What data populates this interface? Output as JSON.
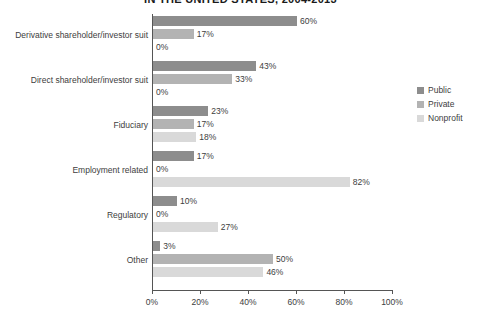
{
  "chart_data": {
    "type": "bar",
    "orientation": "horizontal",
    "title": "IN THE UNITED STATES, 2004-2013",
    "xlabel": "",
    "ylabel": "",
    "xlim": [
      0,
      100
    ],
    "grid": false,
    "legend_position": "right",
    "categories": [
      "Derivative shareholder/investor suit",
      "Direct shareholder/investor suit",
      "Fiduciary",
      "Employment related",
      "Regulatory",
      "Other"
    ],
    "series": [
      {
        "name": "Public",
        "color": "#8d8d8d",
        "values": [
          60,
          43,
          23,
          17,
          10,
          3
        ],
        "labels": [
          "60%",
          "43%",
          "23%",
          "17%",
          "10%",
          "3%"
        ]
      },
      {
        "name": "Private",
        "color": "#b3b3b3",
        "values": [
          17,
          33,
          17,
          0,
          0,
          50
        ],
        "labels": [
          "17%",
          "33%",
          "17%",
          "0%",
          "0%",
          "50%"
        ]
      },
      {
        "name": "Nonprofit",
        "color": "#d9d9d9",
        "values": [
          0,
          0,
          18,
          82,
          27,
          46
        ],
        "labels": [
          "0%",
          "0%",
          "18%",
          "82%",
          "27%",
          "46%"
        ]
      }
    ],
    "xticks": [
      {
        "value": 0,
        "label": "0%"
      },
      {
        "value": 20,
        "label": "20%"
      },
      {
        "value": 40,
        "label": "40%"
      },
      {
        "value": 60,
        "label": "60%"
      },
      {
        "value": 80,
        "label": "80%"
      },
      {
        "value": 100,
        "label": "100%"
      }
    ]
  },
  "legend": {
    "entries": [
      {
        "label": "Public",
        "color": "#8d8d8d"
      },
      {
        "label": "Private",
        "color": "#b3b3b3"
      },
      {
        "label": "Nonprofit",
        "color": "#d9d9d9"
      }
    ]
  },
  "footnote": ""
}
